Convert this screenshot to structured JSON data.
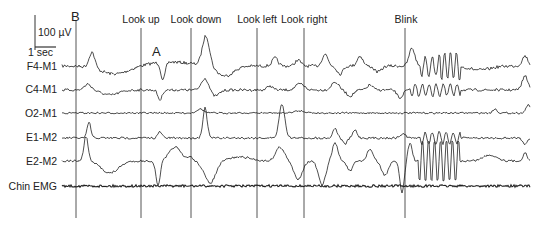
{
  "chart_data": {
    "type": "line",
    "title": "",
    "scale_bar": {
      "amplitude_label": "100 µV",
      "time_label": "1 sec"
    },
    "channels": [
      "F4-M1",
      "C4-M1",
      "O2-M1",
      "E1-M2",
      "E2-M2",
      "Chin EMG"
    ],
    "event_markers": [
      {
        "label": "B",
        "x_px": 76
      },
      {
        "label": "Look up",
        "x_px": 141
      },
      {
        "label": "Look down",
        "x_px": 191
      },
      {
        "label": "Look left",
        "x_px": 257
      },
      {
        "label": "Look right",
        "x_px": 304
      },
      {
        "label": "Blink",
        "x_px": 405
      }
    ],
    "annotations": [
      {
        "label": "A",
        "x_px": 158,
        "y_px": 52
      }
    ],
    "grid": false,
    "legend": "none"
  },
  "labels": {
    "scale_amp": "100 µV",
    "scale_time": "1 sec",
    "marker_b": "B",
    "marker_a": "A",
    "events": [
      "Look up",
      "Look down",
      "Look left",
      "Look right",
      "Blink"
    ],
    "channels": [
      "F4-M1",
      "C4-M1",
      "O2-M1",
      "E1-M2",
      "E2-M2",
      "Chin EMG"
    ]
  }
}
